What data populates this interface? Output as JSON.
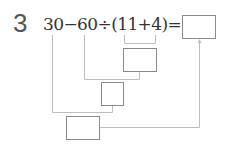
{
  "problem": {
    "number": "3",
    "expression": "30−60÷(11+4)=",
    "tokens": [
      "30",
      "−",
      "60",
      "÷",
      "(",
      "11",
      "+",
      "4",
      ")",
      "="
    ]
  },
  "boxes": [
    {
      "id": "answer",
      "label": "",
      "role": "final result"
    },
    {
      "id": "step1",
      "label": "",
      "role": "result of 11+4"
    },
    {
      "id": "step2",
      "label": "",
      "role": "result of 60÷(11+4)"
    },
    {
      "id": "step3",
      "label": "",
      "role": "result of 30−60÷(11+4)"
    }
  ],
  "colors": {
    "line": "#bdbdbd",
    "box_border": "#8a8a8a",
    "text": "#333333",
    "number": "#555555"
  }
}
